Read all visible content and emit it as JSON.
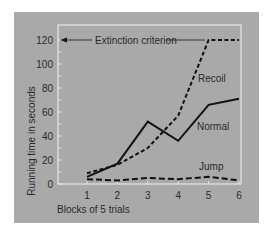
{
  "chart_data": {
    "type": "line",
    "title": "",
    "xlabel": "Blocks of 5 trials",
    "ylabel": "Running time in seconds",
    "categories": [
      "1",
      "2",
      "3",
      "4",
      "5",
      "6"
    ],
    "x": [
      1,
      2,
      3,
      4,
      5,
      6
    ],
    "yticks": [
      0,
      20,
      40,
      60,
      80,
      100,
      120
    ],
    "ylim": [
      0,
      120
    ],
    "grid": false,
    "legend": "inline labels",
    "series": [
      {
        "name": "Normal",
        "style": "solid",
        "values": [
          6,
          17,
          52,
          36,
          66,
          71
        ]
      },
      {
        "name": "Recoil",
        "style": "short-dash",
        "values": [
          9,
          16,
          30,
          57,
          120,
          120
        ]
      },
      {
        "name": "Jump",
        "style": "long-dash",
        "values": [
          4,
          3,
          5,
          4,
          6,
          3
        ]
      }
    ],
    "annotations": [
      {
        "text": "Extinction criterion",
        "y": 120,
        "arrow": "left"
      }
    ]
  },
  "colors": {
    "panel_bg": "#a9a9a9",
    "frame": "#e6e6e6",
    "ink": "#111111",
    "text": "#2a2a2a"
  }
}
